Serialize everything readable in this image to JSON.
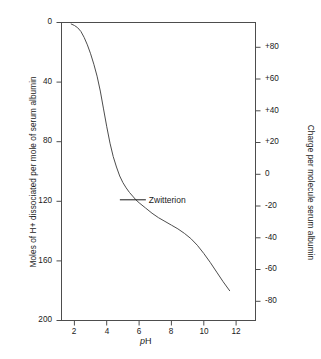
{
  "chart_data": {
    "type": "line",
    "title": "",
    "xlabel": "pH",
    "ylabel": "Moles of H+ dissociated per mole of serum albumin",
    "y2label": "Charge per molecule serum albumin",
    "xlim": [
      1.2,
      13.2
    ],
    "ylim": [
      200,
      0
    ],
    "y2lim": [
      -92,
      96
    ],
    "grid": false,
    "legend": null,
    "xticks": [
      "2",
      "4",
      "6",
      "8",
      "10",
      "12"
    ],
    "xtick_values": [
      2,
      4,
      6,
      8,
      10,
      12
    ],
    "yticks": [
      "0",
      "40",
      "80",
      "120",
      "160",
      "200"
    ],
    "ytick_values": [
      0,
      40,
      80,
      120,
      160,
      200
    ],
    "y2ticks": [
      "+80",
      "+60",
      "+40",
      "+20",
      "0",
      "-20",
      "-40",
      "-60",
      "-80"
    ],
    "y2tick_values": [
      80,
      60,
      40,
      20,
      0,
      -20,
      -40,
      -60,
      -80
    ],
    "series": [
      {
        "name": "serum albumin titration curve",
        "x": [
          1.8,
          2.0,
          2.2,
          2.4,
          2.6,
          2.8,
          3.0,
          3.2,
          3.4,
          3.6,
          3.8,
          4.0,
          4.2,
          4.4,
          4.6,
          4.8,
          5.0,
          5.2,
          5.4,
          5.6,
          5.8,
          6.0,
          6.4,
          6.8,
          7.2,
          7.6,
          8.0,
          8.4,
          8.8,
          9.2,
          9.6,
          10.0,
          10.4,
          10.8,
          11.2,
          11.6
        ],
        "y": [
          1.0,
          2.0,
          3.5,
          6.0,
          10.0,
          15.0,
          21.0,
          28.0,
          36.0,
          46.0,
          58.0,
          70.0,
          81.0,
          90.0,
          97.0,
          103.0,
          107.5,
          111.0,
          114.0,
          116.5,
          119.0,
          121.0,
          124.5,
          128.0,
          131.0,
          133.5,
          136.0,
          138.5,
          141.5,
          145.0,
          149.5,
          155.0,
          161.0,
          167.5,
          174.0,
          180.0
        ]
      }
    ],
    "annotations": [
      {
        "text": "Zwitterion",
        "x": 5.8,
        "y": 119.0,
        "leader_line": true
      }
    ],
    "colors": {
      "curve": "#4d4d4d",
      "axis": "#4d4d4d",
      "text": "#1a1a1a",
      "background": "#ffffff"
    }
  }
}
